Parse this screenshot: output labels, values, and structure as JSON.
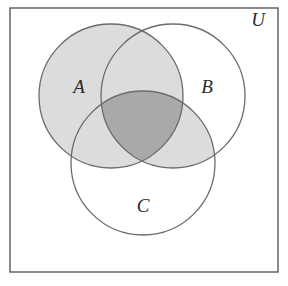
{
  "figure": {
    "kind": "venn-diagram",
    "caption_label_universe": "U",
    "background_color": "#ffffff"
  },
  "universe": {
    "label": "U",
    "border_color": "#6e6e6e",
    "fill_color": "#ffffff",
    "rect": {
      "x": 10,
      "y": 8,
      "width": 268,
      "height": 264
    },
    "label_position": {
      "x": 258,
      "y": 26
    }
  },
  "sets": [
    {
      "id": "A",
      "label": "A",
      "cx": 111,
      "cy": 96,
      "r": 72,
      "stroke_color": "#6b6b6b",
      "label_position": {
        "x": 79,
        "y": 93
      },
      "shaded": true
    },
    {
      "id": "B",
      "label": "B",
      "cx": 173,
      "cy": 96,
      "r": 72,
      "stroke_color": "#6b6b6b",
      "label_position": {
        "x": 207,
        "y": 93
      },
      "shaded": false
    },
    {
      "id": "C",
      "label": "C",
      "cx": 143,
      "cy": 163,
      "r": 72,
      "stroke_color": "#6b6b6b",
      "label_position": {
        "x": 143,
        "y": 212
      },
      "shaded": false
    }
  ],
  "shading": {
    "description": "A union (B intersect C)",
    "light_fill": "#dcdcdc",
    "dark_fill": "#a9a9a9",
    "regions": [
      {
        "name": "A-only",
        "fill": "#dcdcdc"
      },
      {
        "name": "A-intersect-B",
        "fill": "#dcdcdc"
      },
      {
        "name": "A-intersect-C",
        "fill": "#dcdcdc"
      },
      {
        "name": "B-intersect-C",
        "fill": "#dcdcdc"
      },
      {
        "name": "A-intersect-B-intersect-C",
        "fill": "#a9a9a9"
      },
      {
        "name": "B-only",
        "fill": "#ffffff"
      },
      {
        "name": "C-only",
        "fill": "#ffffff"
      }
    ]
  },
  "chart_data": {
    "type": "diagram",
    "title": "",
    "sets": [
      "A",
      "B",
      "C"
    ],
    "universe": "U"
  }
}
